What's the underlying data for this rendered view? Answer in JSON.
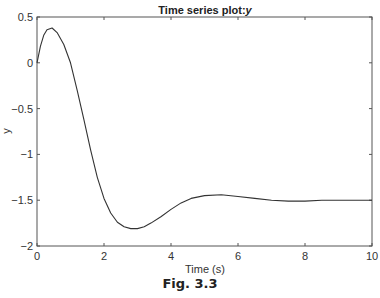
{
  "chart_data": {
    "type": "line",
    "title": "Time series plot:",
    "title_var": "y",
    "xlabel": "Time (s)",
    "ylabel": "y",
    "xlim": [
      0,
      10
    ],
    "ylim": [
      -2,
      0.5
    ],
    "xticks": [
      0,
      2,
      4,
      6,
      8,
      10
    ],
    "xtick_labels": [
      "0",
      "2",
      "4",
      "6",
      "8",
      "10"
    ],
    "yticks": [
      0.5,
      0,
      -0.5,
      -1,
      -1.5,
      -2
    ],
    "ytick_labels": [
      "0.5",
      "0",
      "−0.5",
      "−1",
      "−1.5",
      "−2"
    ],
    "grid": false,
    "legend": null,
    "series": [
      {
        "name": "y",
        "color": "#333333",
        "x": [
          0,
          0.1,
          0.2,
          0.3,
          0.45,
          0.6,
          0.8,
          1.0,
          1.2,
          1.4,
          1.6,
          1.8,
          2.0,
          2.2,
          2.4,
          2.6,
          2.8,
          3.0,
          3.2,
          3.4,
          3.7,
          4.0,
          4.3,
          4.6,
          5.0,
          5.5,
          6.0,
          6.5,
          7.0,
          7.5,
          8.0,
          8.5,
          9.0,
          9.5,
          10.0
        ],
        "values": [
          0.0,
          0.18,
          0.3,
          0.36,
          0.38,
          0.33,
          0.2,
          0.0,
          -0.3,
          -0.62,
          -0.95,
          -1.25,
          -1.48,
          -1.64,
          -1.74,
          -1.79,
          -1.81,
          -1.81,
          -1.79,
          -1.75,
          -1.68,
          -1.6,
          -1.53,
          -1.48,
          -1.45,
          -1.44,
          -1.46,
          -1.48,
          -1.5,
          -1.51,
          -1.51,
          -1.5,
          -1.5,
          -1.5,
          -1.5
        ]
      }
    ]
  },
  "caption": "Fig. 3.3"
}
